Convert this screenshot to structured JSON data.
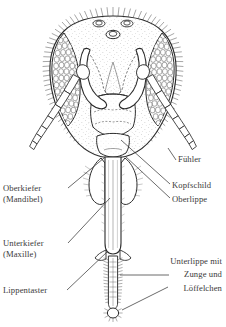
{
  "figure": {
    "type": "scientific-line-illustration",
    "background_color": "#ffffff",
    "ink_color": "#2b2b2b",
    "parts": [
      "compound-eye-left",
      "compound-eye-right",
      "ocelli",
      "antenna-left",
      "antenna-right",
      "clypeus",
      "labrum",
      "mandible-left",
      "mandible-right",
      "maxilla",
      "labial-palp",
      "glossa",
      "flabellum"
    ]
  },
  "labels": {
    "left": [
      {
        "text": "Oberkiefer",
        "name": "label-oberkiefer"
      },
      {
        "text": "(Mandibel)",
        "name": "label-mandibel"
      },
      {
        "text": "Unterkiefer",
        "name": "label-unterkiefer"
      },
      {
        "text": "(Maxille)",
        "name": "label-maxille"
      },
      {
        "text": "Lippentaster",
        "name": "label-lippentaster"
      }
    ],
    "right": [
      {
        "text": "Fühler",
        "name": "label-fuehler"
      },
      {
        "text": "Kopfschild",
        "name": "label-kopfschild"
      },
      {
        "text": "Oberlippe",
        "name": "label-oberlippe"
      },
      {
        "text": "Unterlippe mit",
        "name": "label-unterlippe-line1"
      },
      {
        "text": "Zunge und",
        "name": "label-unterlippe-line2"
      },
      {
        "text": "Löffelchen",
        "name": "label-loeffelchen"
      }
    ]
  }
}
